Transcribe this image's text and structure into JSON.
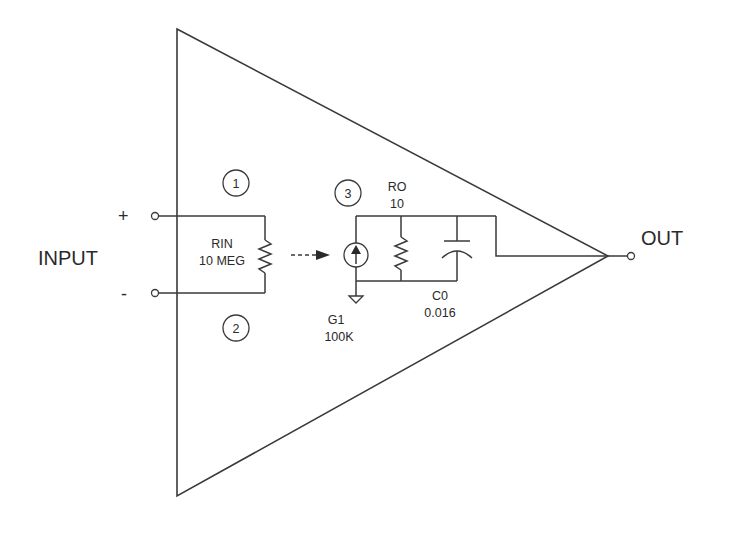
{
  "diagram": {
    "labels": {
      "input": "INPUT",
      "output": "OUT",
      "plus": "+",
      "minus": "-"
    },
    "nodes": [
      {
        "id": "1",
        "label": "1"
      },
      {
        "id": "2",
        "label": "2"
      },
      {
        "id": "3",
        "label": "3"
      }
    ],
    "components": {
      "rin": {
        "name": "RIN",
        "value": "10 MEG"
      },
      "g1": {
        "name": "G1",
        "value": "100K"
      },
      "ro": {
        "name": "RO",
        "value": "10"
      },
      "c0": {
        "name": "C0",
        "value": "0.016"
      }
    },
    "colors": {
      "line": "#3a3a3a",
      "text": "#2a2a2a",
      "background": "#ffffff"
    }
  }
}
